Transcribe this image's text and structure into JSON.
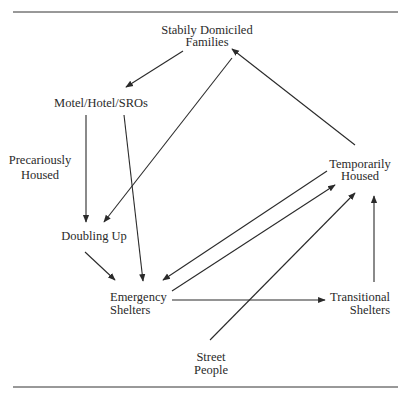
{
  "diagram": {
    "type": "flow-diagram",
    "colors": {
      "line": "#2a2a2a",
      "text": "#2a2a2a",
      "background": "#ffffff"
    },
    "nodes": [
      {
        "id": "stably",
        "lines": [
          "Stabily Domiciled",
          "Families"
        ]
      },
      {
        "id": "motel",
        "lines": [
          "Motel/Hotel/SROs"
        ]
      },
      {
        "id": "precarious",
        "lines": [
          "Precariously",
          "Housed"
        ]
      },
      {
        "id": "doubling",
        "lines": [
          "Doubling Up"
        ]
      },
      {
        "id": "emergency",
        "lines": [
          "Emergency",
          "Shelters"
        ]
      },
      {
        "id": "temporarily",
        "lines": [
          "Temporarily",
          "Housed"
        ]
      },
      {
        "id": "transitional",
        "lines": [
          "Transitional",
          "Shelters"
        ]
      },
      {
        "id": "street",
        "lines": [
          "Street",
          "People"
        ]
      }
    ],
    "edges": [
      {
        "from": "stably",
        "to": "motel"
      },
      {
        "from": "stably",
        "to": "doubling"
      },
      {
        "from": "motel",
        "to": "doubling"
      },
      {
        "from": "motel",
        "to": "emergency"
      },
      {
        "from": "doubling",
        "to": "emergency"
      },
      {
        "from": "temporarily",
        "to": "emergency"
      },
      {
        "from": "emergency",
        "to": "temporarily"
      },
      {
        "from": "temporarily",
        "to": "stably"
      },
      {
        "from": "emergency",
        "to": "transitional"
      },
      {
        "from": "street",
        "to": "temporarily"
      },
      {
        "from": "transitional",
        "to": "temporarily"
      }
    ]
  }
}
